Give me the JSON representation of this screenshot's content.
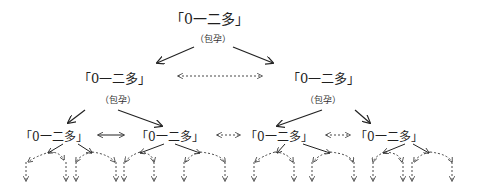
{
  "diagram": {
    "node_label": "「0一二多」",
    "note_label": "（包孕）",
    "levels": [
      {
        "level": 1,
        "nodes": [
          {
            "id": "root",
            "label": "「0一二多」",
            "note": "（包孕）"
          }
        ]
      },
      {
        "level": 2,
        "nodes": [
          {
            "id": "L",
            "label": "「0一二多」",
            "note": "（包孕）"
          },
          {
            "id": "R",
            "label": "「0一二多」",
            "note": "（包孕）"
          }
        ],
        "link": "dashed-bidirectional"
      },
      {
        "level": 3,
        "nodes": [
          {
            "id": "LL",
            "label": "「0一二多」"
          },
          {
            "id": "LR",
            "label": "「0一二多」"
          },
          {
            "id": "RL",
            "label": "「0一二多」"
          },
          {
            "id": "RR",
            "label": "「0一二多」"
          }
        ],
        "links": [
          "solid-bidirectional",
          "dashed-bidirectional",
          "dashed-bidirectional"
        ]
      },
      {
        "level": 4,
        "description": "each level-3 node branches into dashed arrows continuing downward (infinite recursion)"
      }
    ]
  },
  "text": {
    "root": "「0一二多」",
    "root_note": "（包孕）",
    "l2_left": "「0一二多」",
    "l2_left_note": "（包孕）",
    "l2_right": "「0一二多」",
    "l2_right_note": "（包孕）",
    "l3_1": "「0一二多」",
    "l3_2": "「0一二多」",
    "l3_3": "「0一二多」",
    "l3_4": "「0一二多」"
  }
}
